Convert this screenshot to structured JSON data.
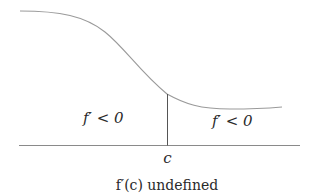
{
  "diagram": {
    "type": "function-graph",
    "labels": {
      "left_region": "f′ < 0",
      "right_region": "f′ < 0",
      "point": "c",
      "caption": "f′(c) undefined"
    },
    "colors": {
      "curve": "#9a9a9a",
      "axis": "#8a8a8a",
      "marker_line": "#555555",
      "text": "#2a2a2a"
    }
  }
}
